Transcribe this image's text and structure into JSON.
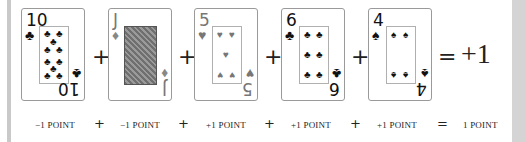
{
  "equation": {
    "cards": [
      {
        "rank": "10",
        "suit": "clubs",
        "suit_glyph": "♣",
        "color": "#111111",
        "points_label": "−1 POINT"
      },
      {
        "rank": "J",
        "suit": "diamonds",
        "suit_glyph": "♦",
        "color": "#888888",
        "points_label": "−1 POINT"
      },
      {
        "rank": "5",
        "suit": "hearts",
        "suit_glyph": "♥",
        "color": "#777777",
        "points_label": "+1 POINT"
      },
      {
        "rank": "6",
        "suit": "clubs",
        "suit_glyph": "♣",
        "color": "#111111",
        "points_label": "+1 POINT"
      },
      {
        "rank": "4",
        "suit": "spades",
        "suit_glyph": "♠",
        "color": "#111111",
        "points_label": "+1 POINT"
      }
    ],
    "operators": {
      "plus": "+",
      "equals": "="
    },
    "result": "+1",
    "result_label": "1 POINT"
  }
}
